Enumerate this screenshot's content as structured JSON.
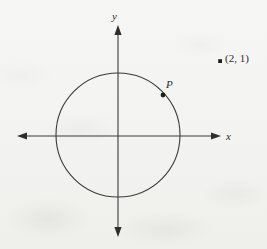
{
  "figure": {
    "name": "circle-with-external-point-diagram",
    "background_color": "#f5f5f3",
    "ink_color": "#333333"
  },
  "axes": {
    "x_label": "x",
    "y_label": "y",
    "origin": {
      "x": 118,
      "y": 136
    },
    "x_axis": {
      "start_x": 17,
      "end_x": 221,
      "y": 136
    },
    "y_axis": {
      "x": 118,
      "start_y": 25,
      "end_y": 237
    }
  },
  "circle": {
    "center_x": 118,
    "center_y": 135,
    "radius": 62,
    "stroke_color": "#333333"
  },
  "points": [
    {
      "id": "point-p",
      "label": "P",
      "x": 163,
      "y": 95,
      "on_circle": true
    },
    {
      "id": "point-coordinate",
      "label": "(2, 1)",
      "x": 220,
      "y": 61,
      "on_circle": false
    }
  ]
}
